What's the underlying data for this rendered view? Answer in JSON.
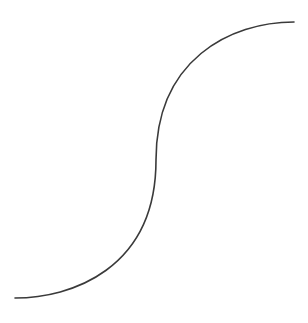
{
  "figure": {
    "kind": "s-curve line drawing",
    "width": 308,
    "height": 323,
    "background": "#ffffff",
    "stroke_color": "#3a3a3a",
    "stroke_width": 1.6,
    "curve": {
      "start": [
        15,
        298
      ],
      "inflection": [
        156,
        160
      ],
      "end": [
        294,
        22
      ],
      "path": "M 15 298 C 70 298, 156 270, 156 160 C 156 60, 230 22, 294 22"
    }
  }
}
